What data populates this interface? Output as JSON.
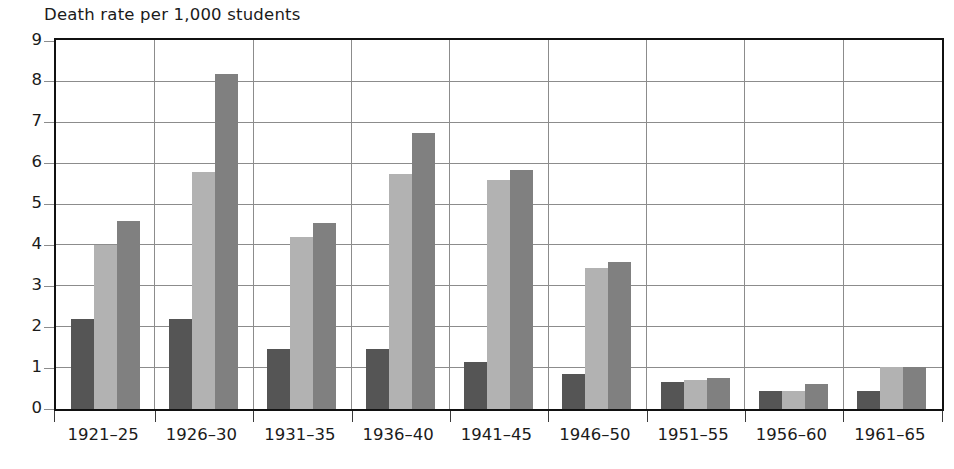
{
  "chart_data": {
    "type": "bar",
    "title": "Death rate per 1,000 students",
    "xlabel": "",
    "ylabel": "Death rate per 1,000 students",
    "ylim": [
      0,
      9
    ],
    "yticks": [
      "0",
      "1",
      "2",
      "3",
      "4",
      "5",
      "6",
      "7",
      "8",
      "9"
    ],
    "grid": true,
    "legend": "none",
    "categories": [
      "1921–25",
      "1926–30",
      "1931–35",
      "1936–40",
      "1941–45",
      "1946–50",
      "1951–55",
      "1956–60",
      "1961–65"
    ],
    "series": [
      {
        "name": "series-1",
        "color": "#555555",
        "values": [
          2.2,
          2.2,
          1.48,
          1.48,
          1.15,
          0.85,
          0.65,
          0.45,
          0.43
        ]
      },
      {
        "name": "series-2",
        "color": "#b2b2b2",
        "values": [
          4.0,
          5.8,
          4.2,
          5.75,
          5.6,
          3.45,
          0.72,
          0.45,
          1.03
        ]
      },
      {
        "name": "series-3",
        "color": "#808080",
        "values": [
          4.6,
          8.2,
          4.55,
          6.75,
          5.85,
          3.6,
          0.75,
          0.6,
          1.02
        ]
      }
    ]
  },
  "style": {
    "frame_color": "#111111",
    "grid_color": "#8c8c8c",
    "text_color": "#1b1b1b",
    "background": "#ffffff"
  }
}
